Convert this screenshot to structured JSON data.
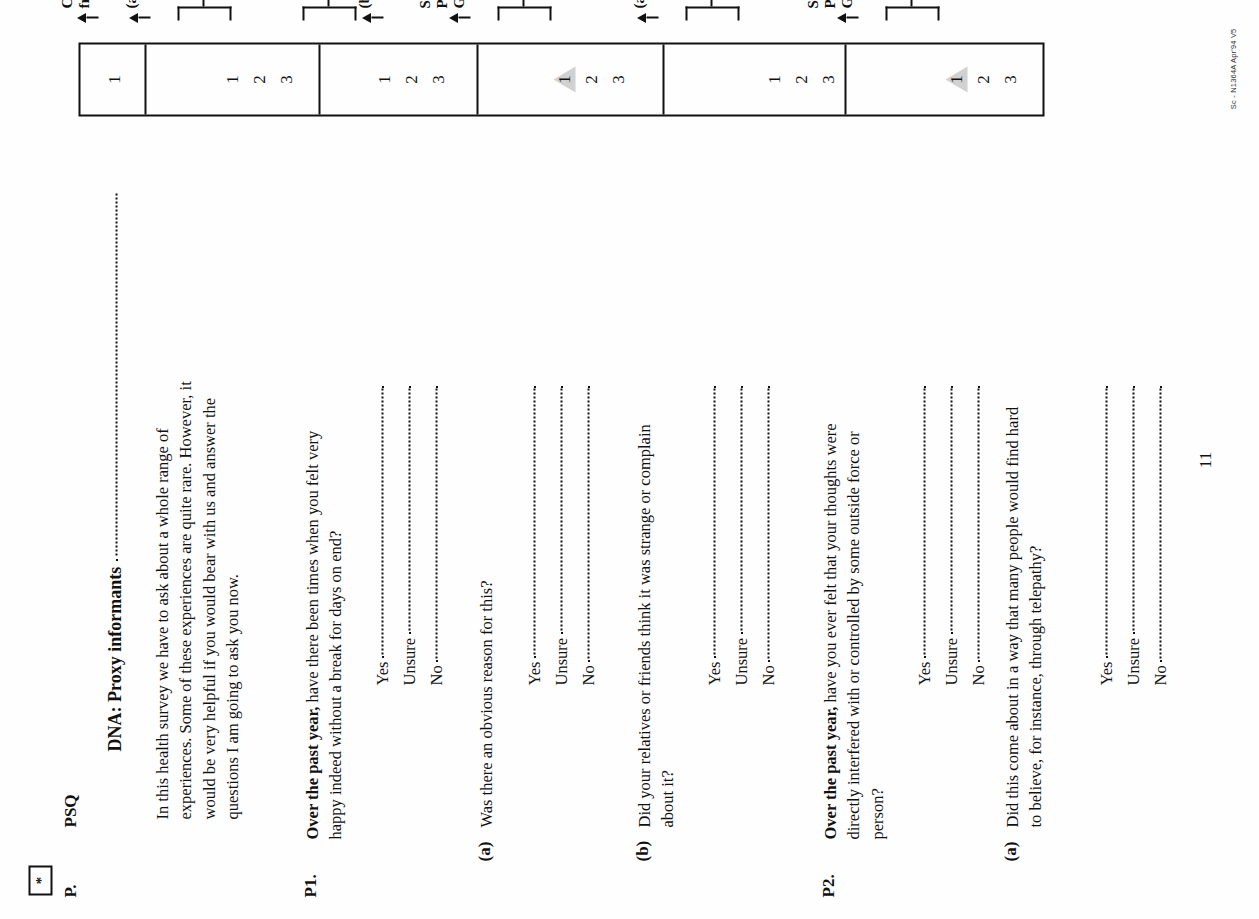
{
  "document": {
    "type": "scanned-questionnaire-page",
    "orientation": "rotated-90-ccw",
    "star_marker": "*",
    "section_letter": "P.",
    "section_code": "PSQ",
    "section_title": "DNA: Proxy informants",
    "intro": "In this health survey we have to ask about a whole range of experiences. Some of these experiences are quite rare. However, it would be very helpful if you would bear with us and answer the questions I am going to ask you now.",
    "page_number": "11",
    "form_code": "Sc - N1364A Apr'94 V5"
  },
  "grid": {
    "first_cell_value": "1",
    "codes": [
      "1",
      "2",
      "3"
    ],
    "shaded_marker_code": "1"
  },
  "options": {
    "yes": "Yes",
    "unsure": "Unsure",
    "no": "No"
  },
  "routes": {
    "complete_front_page": "Complete\nfront page",
    "goto_a": "(a)",
    "goto_b": "(b)",
    "goto_p2": "P2",
    "goto_p3": "P3",
    "screen_positive_p6": "Screen\nPositive,\nGo to P6"
  },
  "questions": [
    {
      "id": "P1",
      "number": "P1.",
      "lead": "Over the past year,",
      "text": " have there been times when you felt very happy indeed without a break for days on end?",
      "route_single": "(a)",
      "route_bracket": "P2"
    },
    {
      "id": "P1a",
      "number": "(a)",
      "lead": "",
      "text": "Was there an obvious reason for this?",
      "route_single": "(b)",
      "route_bracket": "P2"
    },
    {
      "id": "P1b",
      "number": "(b)",
      "lead": "",
      "text": "Did your relatives or friends think it was strange or complain about it?",
      "route_single": "Screen\nPositive,\nGo to P6",
      "route_bracket": "P2"
    },
    {
      "id": "P2",
      "number": "P2.",
      "lead": "Over the past year,",
      "text": " have you ever felt that your thoughts were directly interfered with or controlled by some outside force or person?",
      "route_single": "(a)",
      "route_bracket": "P3"
    },
    {
      "id": "P2a",
      "number": "(a)",
      "lead": "",
      "text": "Did this come about in a way that many people would find hard to believe, for instance, through telepathy?",
      "route_single": "Screen\nPositive,\nGo to P6",
      "route_bracket": "P3"
    }
  ]
}
